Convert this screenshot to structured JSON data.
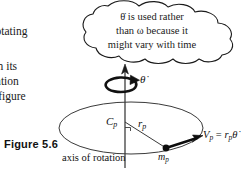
{
  "page": {
    "background_color": "#ffffff",
    "ink_color": "#111111"
  },
  "body_text": {
    "lines": [
      "y rotating",
      "ng in its",
      "rotation",
      "θ̇ (figure"
    ]
  },
  "figure": {
    "caption": "Figure 5.6",
    "callout": {
      "shape": "cloud",
      "lines": [
        "θ̇ is used rather",
        "than ω because it",
        "might vary with time"
      ]
    },
    "labels": {
      "axis_rotation_rate": "θ̇",
      "center_point": "C",
      "center_point_sub": "p",
      "radius": "r",
      "radius_sub": "p",
      "mass": "m",
      "mass_sub": "p",
      "velocity_equation": "V",
      "velocity_sub": "p",
      "velocity_equals": " = ",
      "velocity_r": "r",
      "velocity_r_sub": "p",
      "velocity_thetadot": "θ̇",
      "axis_label": "axis of rotation"
    },
    "elements": [
      "vertical-rotation-axis",
      "upward-arrowhead",
      "curved-rotation-arrow",
      "horizontal-circular-path-ellipse",
      "radius-line",
      "right-angle-marker",
      "point-mass-dot",
      "velocity-vector-arrow"
    ]
  }
}
